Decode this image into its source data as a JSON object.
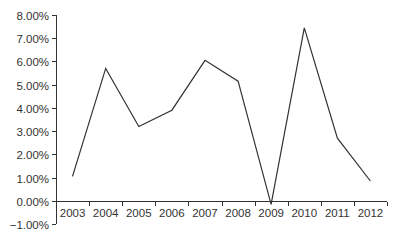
{
  "chart_data": {
    "type": "line",
    "title": "",
    "xlabel": "",
    "ylabel": "",
    "categories": [
      "2003",
      "2004",
      "2005",
      "2006",
      "2007",
      "2008",
      "2009",
      "2010",
      "2011",
      "2012"
    ],
    "series": [
      {
        "name": "Series 1",
        "values": [
          1.05,
          5.7,
          3.2,
          3.9,
          6.05,
          5.15,
          -0.15,
          7.45,
          2.7,
          0.85
        ],
        "color": "#333333"
      }
    ],
    "ylim": [
      -1,
      8
    ],
    "y_ticks": [
      8,
      7,
      6,
      5,
      4,
      3,
      2,
      1,
      0,
      -1
    ],
    "y_tick_labels": [
      "8.00%",
      "7.00%",
      "6.00%",
      "5.00%",
      "4.00%",
      "3.00%",
      "2.00%",
      "1.00%",
      "0.00%",
      "−1.00%"
    ],
    "grid": false,
    "legend": "none",
    "x_axis_at": 0
  }
}
